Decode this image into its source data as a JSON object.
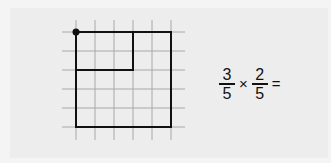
{
  "figure": {
    "grid": {
      "cols": 5,
      "rows": 5,
      "cell_px": 19,
      "origin_x": 76,
      "origin_y": 32,
      "line_color": "#a8a8a8"
    },
    "outer_rect": {
      "col": 0,
      "row": 0,
      "w": 5,
      "h": 5
    },
    "inner_rect": {
      "col": 0,
      "row": 0,
      "w": 3,
      "h": 2
    },
    "dot": "corner-dot",
    "outline_color": "#111111"
  },
  "equation": {
    "fraction1": {
      "numerator": "3",
      "denominator": "5"
    },
    "operator": "×",
    "fraction2": {
      "numerator": "2",
      "denominator": "5"
    },
    "equals": "="
  }
}
